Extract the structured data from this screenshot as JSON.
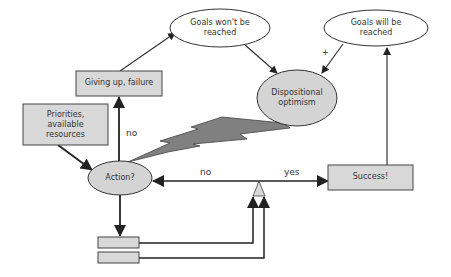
{
  "nodes": {
    "goals_wont": {
      "label_line1": "Goals won't be",
      "label_line2": "reached"
    },
    "goals_will": {
      "label_line1": "Goals will be",
      "label_line2": "reached"
    },
    "giving_up": {
      "label": "Giving up, failure"
    },
    "priorities": {
      "label_line1": "Priorities,",
      "label_line2": "available",
      "label_line3": "resources"
    },
    "optimism": {
      "label_line1": "Dispositional",
      "label_line2": "optimism"
    },
    "action": {
      "label": "Action?"
    },
    "success": {
      "label": "Success!"
    },
    "small_box_1": {
      "label": ""
    },
    "small_box_2": {
      "label": ""
    }
  },
  "edges": {
    "action_to_giving_up": {
      "label": "no"
    },
    "balance_to_action": {
      "label": "no"
    },
    "balance_to_success": {
      "label": "yes"
    },
    "goals_will_to_optimism": {
      "label": "+"
    }
  },
  "colors": {
    "box_fill": "#d8d8d8",
    "ellipse_fill": "#d4d4d4",
    "lightning_fill": "#808080",
    "stroke": "#333333",
    "arrow": "#222222"
  }
}
